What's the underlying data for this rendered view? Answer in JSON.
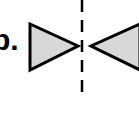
{
  "diagram": {
    "label": "b.",
    "fill_color": "#d8d8d8",
    "stroke_color": "#000000",
    "shapes": [
      {
        "name": "left-triangle",
        "points": "30,24 30,70 78,46"
      },
      {
        "name": "right-triangle",
        "points": "139,24 139,70 91,46"
      }
    ],
    "axis": {
      "name": "symmetry-axis",
      "style": "dashed",
      "x": 82
    }
  }
}
